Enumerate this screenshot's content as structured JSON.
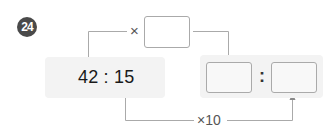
{
  "problem": {
    "number": "24"
  },
  "ratio": {
    "text": "42 : 15",
    "left_term": "42",
    "right_term": "15"
  },
  "top_operation": {
    "operator": "×",
    "answer_value": ""
  },
  "bottom_operation": {
    "label": "×10"
  },
  "result_ratio": {
    "left_answer": "",
    "separator": ":",
    "right_answer": ""
  },
  "colors": {
    "badge_bg": "#4a4a4a",
    "panel_bg": "#f3f3f3",
    "box_border": "#aaaaaa",
    "line": "#aaaaaa",
    "text": "#1a1a1a"
  }
}
